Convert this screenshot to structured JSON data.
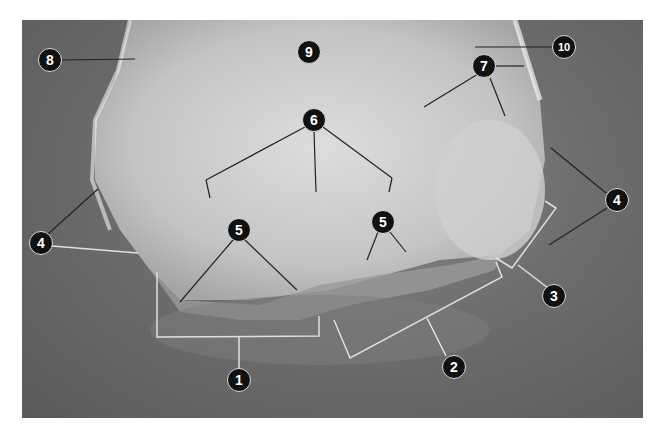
{
  "figure": {
    "colors": {
      "background": "#6e6e6e",
      "bone": "#d8d8d8",
      "callout_fill": "#111111",
      "callout_text": "#ffffff",
      "leader_line": "#333333",
      "bracket_line": "#e0e0e0"
    },
    "callouts": [
      {
        "label": "1",
        "x": 239,
        "y": 380
      },
      {
        "label": "2",
        "x": 454,
        "y": 367
      },
      {
        "label": "3",
        "x": 554,
        "y": 296
      },
      {
        "label": "4",
        "x": 41,
        "y": 243
      },
      {
        "label": "4",
        "x": 617,
        "y": 200
      },
      {
        "label": "5",
        "x": 239,
        "y": 230
      },
      {
        "label": "5",
        "x": 383,
        "y": 222
      },
      {
        "label": "6",
        "x": 314,
        "y": 120
      },
      {
        "label": "7",
        "x": 484,
        "y": 66
      },
      {
        "label": "8",
        "x": 50,
        "y": 60
      },
      {
        "label": "9",
        "x": 309,
        "y": 52
      },
      {
        "label": "10",
        "x": 564,
        "y": 47
      }
    ]
  }
}
